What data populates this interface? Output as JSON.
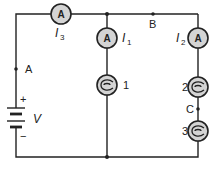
{
  "diagram": {
    "type": "circuit",
    "colors": {
      "wire": "#222222",
      "component_fill": "#d4d4d4",
      "background": "#ffffff"
    },
    "ammeters": [
      {
        "id": "ammeter-3",
        "symbol": "A",
        "current_label": "I",
        "current_sub": "3"
      },
      {
        "id": "ammeter-1",
        "symbol": "A",
        "current_label": "I",
        "current_sub": "1"
      },
      {
        "id": "ammeter-2",
        "symbol": "A",
        "current_label": "I",
        "current_sub": "2"
      }
    ],
    "bulbs": [
      {
        "id": "bulb-1",
        "label": "1"
      },
      {
        "id": "bulb-2",
        "label": "2"
      },
      {
        "id": "bulb-3",
        "label": "3"
      }
    ],
    "points": [
      {
        "id": "point-a",
        "label": "A"
      },
      {
        "id": "point-b",
        "label": "B"
      },
      {
        "id": "point-c",
        "label": "C"
      }
    ],
    "battery": {
      "voltage_label": "V",
      "plus": "+",
      "minus": "−"
    }
  }
}
